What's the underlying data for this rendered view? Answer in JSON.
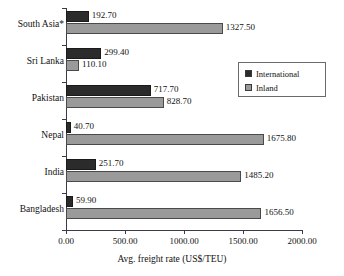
{
  "chart_data": {
    "type": "bar",
    "orientation": "horizontal",
    "title": "",
    "xlabel": "Avg. freight rate (US$/TEU)",
    "ylabel": "",
    "xlim": [
      0,
      2000
    ],
    "xticks": [
      "0.00",
      "500.00",
      "1000.00",
      "1500.00",
      "2000.00"
    ],
    "xtick_values": [
      0,
      500,
      1000,
      1500,
      2000
    ],
    "grid": false,
    "legend_position": "upper right",
    "categories": [
      "South Asia*",
      "Sri Lanka",
      "Pakistan",
      "Nepal",
      "India",
      "Bangladesh"
    ],
    "series": [
      {
        "name": "International",
        "color": "#2b2b2b",
        "values": [
          192.7,
          299.4,
          717.7,
          40.7,
          251.7,
          59.9
        ],
        "labels": [
          "192.70",
          "299.40",
          "717.70",
          "40.70",
          "251.70",
          "59.90"
        ]
      },
      {
        "name": "Inland",
        "color": "#9a9a9a",
        "values": [
          1327.5,
          110.1,
          828.7,
          1675.8,
          1485.2,
          1656.5
        ],
        "labels": [
          "1327.50",
          "110.10",
          "828.70",
          "1675.80",
          "1485.20",
          "1656.50"
        ]
      }
    ]
  },
  "legend": {
    "items": [
      {
        "label": "International",
        "color": "#2b2b2b"
      },
      {
        "label": "Inland",
        "color": "#9a9a9a"
      }
    ]
  },
  "colors": {
    "international": "#2b2b2b",
    "inland": "#9a9a9a",
    "axis": "#3a3a4a",
    "text": "#111111",
    "background": "#ffffff"
  }
}
